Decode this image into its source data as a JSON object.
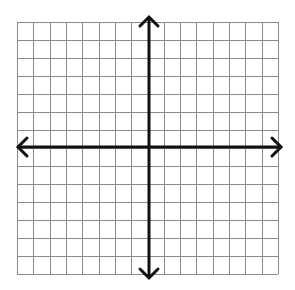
{
  "grid": {
    "columns": 16,
    "rows": 14,
    "left": 17,
    "right": 278,
    "top": 22,
    "bottom": 274,
    "origin_x": 149,
    "origin_y": 147,
    "grid_color": "#8a8a8a",
    "axis_color": "#111111"
  },
  "axes": {
    "x_axis": {
      "from": 18,
      "to": 281,
      "arrows": "both"
    },
    "y_axis": {
      "from": 17,
      "to": 278,
      "arrows": "both"
    }
  }
}
